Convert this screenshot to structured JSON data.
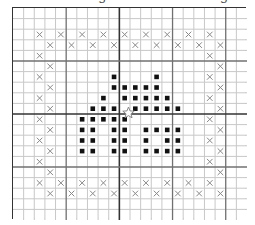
{
  "title": "Puzzle: Bring Stones to the Edge",
  "board": {
    "cols": 22,
    "rows": 20,
    "major_every": 5,
    "center_col_line": 10,
    "center_row_line": 10,
    "colors": {
      "grid_line": "#c8c8c8",
      "major_line": "#707070",
      "center_line": "#333333",
      "border": "#333333",
      "stone": "#111111",
      "cross": "#888888",
      "cursor_outline": "#888888"
    },
    "crosses": [
      [
        2,
        2
      ],
      [
        4,
        2
      ],
      [
        6,
        2
      ],
      [
        8,
        2
      ],
      [
        10,
        2
      ],
      [
        12,
        2
      ],
      [
        14,
        2
      ],
      [
        16,
        2
      ],
      [
        18,
        2
      ],
      [
        3,
        3
      ],
      [
        5,
        3
      ],
      [
        7,
        3
      ],
      [
        9,
        3
      ],
      [
        11,
        3
      ],
      [
        13,
        3
      ],
      [
        15,
        3
      ],
      [
        17,
        3
      ],
      [
        19,
        3
      ],
      [
        2,
        4
      ],
      [
        18,
        4
      ],
      [
        3,
        5
      ],
      [
        19,
        5
      ],
      [
        2,
        6
      ],
      [
        18,
        6
      ],
      [
        3,
        7
      ],
      [
        19,
        7
      ],
      [
        2,
        8
      ],
      [
        18,
        8
      ],
      [
        3,
        9
      ],
      [
        19,
        9
      ],
      [
        2,
        10
      ],
      [
        18,
        10
      ],
      [
        3,
        11
      ],
      [
        19,
        11
      ],
      [
        2,
        12
      ],
      [
        18,
        12
      ],
      [
        3,
        13
      ],
      [
        19,
        13
      ],
      [
        2,
        14
      ],
      [
        18,
        14
      ],
      [
        3,
        15
      ],
      [
        19,
        15
      ],
      [
        2,
        16
      ],
      [
        4,
        16
      ],
      [
        6,
        16
      ],
      [
        8,
        16
      ],
      [
        10,
        16
      ],
      [
        12,
        16
      ],
      [
        14,
        16
      ],
      [
        16,
        16
      ],
      [
        18,
        16
      ],
      [
        3,
        17
      ],
      [
        5,
        17
      ],
      [
        7,
        17
      ],
      [
        9,
        17
      ],
      [
        11,
        17
      ],
      [
        13,
        17
      ],
      [
        15,
        17
      ],
      [
        17,
        17
      ],
      [
        19,
        17
      ]
    ],
    "stones": [
      [
        9,
        6
      ],
      [
        13,
        6
      ],
      [
        9,
        7
      ],
      [
        10,
        7
      ],
      [
        11,
        7
      ],
      [
        12,
        7
      ],
      [
        13,
        7
      ],
      [
        8,
        8
      ],
      [
        10,
        8
      ],
      [
        11,
        8
      ],
      [
        12,
        8
      ],
      [
        13,
        8
      ],
      [
        14,
        8
      ],
      [
        7,
        9
      ],
      [
        8,
        9
      ],
      [
        9,
        9
      ],
      [
        11,
        9
      ],
      [
        12,
        9
      ],
      [
        13,
        9
      ],
      [
        14,
        9
      ],
      [
        15,
        9
      ],
      [
        6,
        10
      ],
      [
        7,
        10
      ],
      [
        8,
        10
      ],
      [
        9,
        10
      ],
      [
        10,
        10
      ],
      [
        6,
        11
      ],
      [
        7,
        11
      ],
      [
        9,
        11
      ],
      [
        10,
        11
      ],
      [
        12,
        11
      ],
      [
        13,
        11
      ],
      [
        14,
        11
      ],
      [
        15,
        11
      ],
      [
        6,
        12
      ],
      [
        7,
        12
      ],
      [
        9,
        12
      ],
      [
        10,
        12
      ],
      [
        12,
        12
      ],
      [
        14,
        12
      ],
      [
        15,
        12
      ],
      [
        6,
        13
      ],
      [
        7,
        13
      ],
      [
        9,
        13
      ],
      [
        10,
        13
      ],
      [
        12,
        13
      ],
      [
        13,
        13
      ],
      [
        14,
        13
      ],
      [
        15,
        13
      ]
    ],
    "cursor": {
      "col_line": 11,
      "row_line": 10,
      "shape": "star-outline"
    }
  }
}
